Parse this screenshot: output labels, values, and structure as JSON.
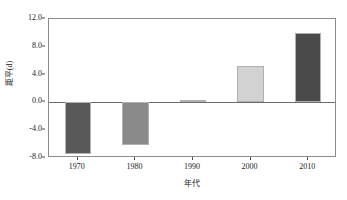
{
  "chart_data": {
    "type": "bar",
    "title": "",
    "subtitle": "",
    "xlabel": "年代",
    "ylabel": "距平(d)",
    "categories": [
      "1970",
      "1980",
      "1990",
      "2000",
      "2010"
    ],
    "values": [
      -7.4,
      -6.2,
      0.3,
      5.2,
      10.0
    ],
    "series": [
      {
        "name": "距平(d)",
        "values": [
          -7.4,
          -6.2,
          0.3,
          5.2,
          10.0
        ]
      }
    ],
    "bar_colors": [
      "#595959",
      "#8a8a8a",
      "#b5b5b5",
      "#d2d2d2",
      "#4a4a4a"
    ],
    "bar_edge_color": "#b0b0b0",
    "ylim": [
      -8.0,
      12.0
    ],
    "yticks": [
      12.0,
      8.0,
      4.0,
      0.0,
      -4.0,
      -8.0
    ],
    "ytick_labels": [
      "12.0",
      "8.0",
      "4.0",
      "0.0",
      "-4.0",
      "-8.0"
    ],
    "xtick_labels": [
      "1970",
      "1980",
      "1990",
      "2000",
      "2010"
    ],
    "grid": false,
    "legend": null,
    "zero_line": 0.0,
    "frame_color": "#8c8c8c",
    "axis_text_color": "#1a1a1a"
  }
}
